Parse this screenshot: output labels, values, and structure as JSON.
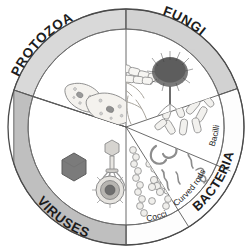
{
  "figure": {
    "shape": "circle-wheel",
    "center": {
      "x": 126,
      "y": 127
    },
    "outer_radius": 118,
    "inner_radius": 98,
    "background": "#ffffff",
    "outline_color": "#4a4a4a",
    "drawing_color": "#7d7d7d"
  },
  "ring_segments": [
    {
      "id": "protozoa",
      "label": "PROTOZOA",
      "band_fill": "#d9d9d9",
      "start_angle": 198,
      "end_angle": 270,
      "font_size": 13.5,
      "bold": true
    },
    {
      "id": "fungi",
      "label": "FUNGI",
      "band_fill": "#d2d2d2",
      "start_angle": 270,
      "end_angle": 341,
      "font_size": 13.5,
      "bold": true
    },
    {
      "id": "bacteria",
      "label": "BACTERIA",
      "band_fill": "#ffffff",
      "start_angle": 341,
      "end_angle": 90,
      "font_size": 13.0,
      "bold": true
    },
    {
      "id": "viruses",
      "label": "VIRUSES",
      "band_fill": "#bfbfbf",
      "start_angle": 90,
      "end_angle": 198,
      "font_size": 13.5,
      "bold": true
    }
  ],
  "wedges": [
    {
      "id": "protozoa-wedge",
      "group": "PROTOZOA",
      "sub_label": "",
      "start_angle": 198,
      "end_angle": 270,
      "fill": "#ffffff",
      "organisms": "paramecium-protozoa"
    },
    {
      "id": "fungi-wedge",
      "group": "FUNGI",
      "sub_label": "",
      "start_angle": 270,
      "end_angle": 341,
      "fill": "#ffffff",
      "organisms": "hyphae-and-sporangium"
    },
    {
      "id": "bacilli-wedge",
      "group": "BACTERIA",
      "sub_label": "Bacilli",
      "sub_label_size": 8.5,
      "start_angle": 341,
      "end_angle": 22,
      "fill": "#ffffff",
      "organisms": "rod-bacteria"
    },
    {
      "id": "curved-rods-wedge",
      "group": "BACTERIA",
      "sub_label": "Curved rods",
      "sub_label_size": 8.5,
      "start_angle": 22,
      "end_angle": 58,
      "fill": "#ffffff",
      "organisms": "vibrio-spirilla-spirochete"
    },
    {
      "id": "cocci-wedge",
      "group": "BACTERIA",
      "sub_label": "Cocci",
      "sub_label_size": 8.5,
      "start_angle": 58,
      "end_angle": 90,
      "fill": "#ffffff",
      "organisms": "cocci-chains-clusters-pairs"
    }
  ],
  "legend_text": {
    "protozoa": "PROTOZOA",
    "fungi": "FUNGI",
    "bacteria": "BACTERIA",
    "viruses": "VIRUSES",
    "bacilli": "Bacilli",
    "curved_rods": "Curved rods",
    "cocci": "Cocci"
  }
}
